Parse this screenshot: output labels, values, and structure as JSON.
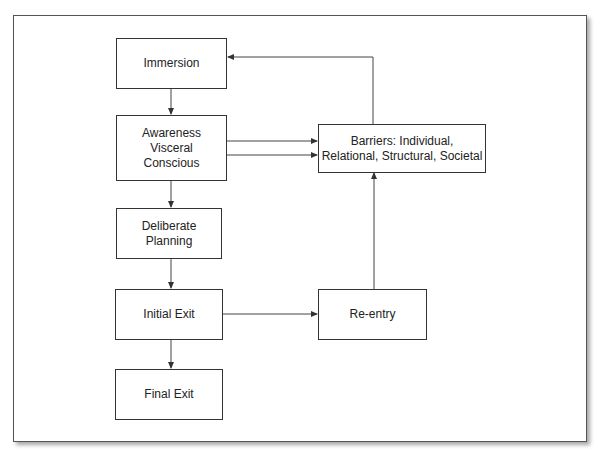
{
  "diagram": {
    "nodes": [
      {
        "id": "immersion",
        "label": "Immersion"
      },
      {
        "id": "awareness",
        "label": "Awareness\nVisceral\nConscious"
      },
      {
        "id": "deliberate-planning",
        "label": "Deliberate\nPlanning"
      },
      {
        "id": "initial-exit",
        "label": "Initial Exit"
      },
      {
        "id": "final-exit",
        "label": "Final Exit"
      },
      {
        "id": "barriers",
        "label": "Barriers: Individual,\nRelational, Structural, Societal"
      },
      {
        "id": "re-entry",
        "label": "Re-entry"
      }
    ],
    "edges": [
      {
        "from": "immersion",
        "to": "awareness"
      },
      {
        "from": "awareness",
        "to": "deliberate-planning"
      },
      {
        "from": "deliberate-planning",
        "to": "initial-exit"
      },
      {
        "from": "initial-exit",
        "to": "final-exit"
      },
      {
        "from": "awareness",
        "to": "barriers"
      },
      {
        "from": "awareness",
        "to": "barriers"
      },
      {
        "from": "initial-exit",
        "to": "re-entry"
      },
      {
        "from": "re-entry",
        "to": "barriers"
      },
      {
        "from": "barriers",
        "to": "immersion"
      }
    ],
    "colors": {
      "line": "#333333",
      "background": "#ffffff"
    }
  }
}
